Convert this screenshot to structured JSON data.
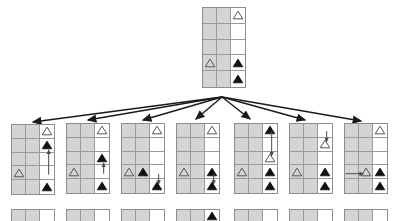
{
  "figure": {
    "colors": {
      "shaded_cell": "#d4d4d4",
      "empty_cell": "#ffffff",
      "grid_line": "#9a9a9a",
      "node_border": "#8d8d8d",
      "edge_arrow": "#1a1a1a",
      "move_arrow": "#4a4a4a",
      "token_fill": "#111111",
      "token_outline": "#555555"
    },
    "grid": {
      "columns": 3,
      "rows": 5,
      "shaded_columns": [
        0,
        1
      ],
      "open_columns": [
        2
      ]
    },
    "token_types": {
      "filled": "filled-triangle",
      "outline": "outline-triangle"
    }
  },
  "root": {
    "label": "root-state",
    "x": 202,
    "y": 7,
    "width": 44,
    "height": 81,
    "tokens": [
      {
        "row": 0,
        "col": 2,
        "type": "outline"
      },
      {
        "row": 3,
        "col": 0,
        "type": "outline"
      },
      {
        "row": 3,
        "col": 2,
        "type": "filled"
      },
      {
        "row": 4,
        "col": 2,
        "type": "filled"
      }
    ],
    "move_arrows": []
  },
  "edges": {
    "origin_x": 222,
    "origin_y": 97,
    "count": 7,
    "targets": [
      {
        "x": 33,
        "y": 122
      },
      {
        "x": 88,
        "y": 120
      },
      {
        "x": 143,
        "y": 120
      },
      {
        "x": 196,
        "y": 119
      },
      {
        "x": 250,
        "y": 119
      },
      {
        "x": 305,
        "y": 120
      },
      {
        "x": 361,
        "y": 121
      }
    ]
  },
  "children": [
    {
      "label": "child-state-1",
      "x": 11,
      "y": 124,
      "width": 44,
      "height": 71,
      "tokens": [
        {
          "row": 0,
          "col": 2,
          "type": "outline"
        },
        {
          "row": 1,
          "col": 2,
          "type": "filled"
        },
        {
          "row": 3,
          "col": 0,
          "type": "outline"
        },
        {
          "row": 4,
          "col": 2,
          "type": "filled"
        }
      ],
      "move_arrows": [
        {
          "col": 2,
          "from_row": 3,
          "to_row": 1,
          "direction": "up"
        }
      ]
    },
    {
      "label": "child-state-2",
      "x": 66,
      "y": 123,
      "width": 44,
      "height": 71,
      "tokens": [
        {
          "row": 0,
          "col": 2,
          "type": "outline"
        },
        {
          "row": 2,
          "col": 2,
          "type": "filled"
        },
        {
          "row": 3,
          "col": 0,
          "type": "outline"
        },
        {
          "row": 4,
          "col": 2,
          "type": "filled"
        }
      ],
      "move_arrows": [
        {
          "col": 2,
          "from_row": 3,
          "to_row": 2,
          "direction": "up"
        }
      ]
    },
    {
      "label": "child-state-3",
      "x": 121,
      "y": 123,
      "width": 44,
      "height": 71,
      "tokens": [
        {
          "row": 0,
          "col": 2,
          "type": "outline"
        },
        {
          "row": 3,
          "col": 0,
          "type": "outline"
        },
        {
          "row": 3,
          "col": 1,
          "type": "filled"
        },
        {
          "row": 4,
          "col": 2,
          "type": "filled"
        }
      ],
      "move_arrows": [
        {
          "col": 2,
          "from_row": 3,
          "to_row": 4,
          "direction": "down"
        }
      ]
    },
    {
      "label": "child-state-4",
      "x": 176,
      "y": 123,
      "width": 44,
      "height": 71,
      "tokens": [
        {
          "row": 0,
          "col": 2,
          "type": "outline"
        },
        {
          "row": 3,
          "col": 0,
          "type": "outline"
        },
        {
          "row": 3,
          "col": 2,
          "type": "filled"
        },
        {
          "row": 4,
          "col": 2,
          "type": "filled"
        }
      ],
      "move_arrows": [
        {
          "col": 2,
          "from_row": 3,
          "to_row": 4,
          "direction": "down"
        }
      ]
    },
    {
      "label": "child-state-5",
      "x": 234,
      "y": 123,
      "width": 44,
      "height": 71,
      "tokens": [
        {
          "row": 0,
          "col": 2,
          "type": "filled"
        },
        {
          "row": 2,
          "col": 2,
          "type": "outline"
        },
        {
          "row": 3,
          "col": 0,
          "type": "outline"
        },
        {
          "row": 3,
          "col": 2,
          "type": "filled"
        },
        {
          "row": 4,
          "col": 2,
          "type": "filled"
        }
      ],
      "move_arrows": [
        {
          "col": 2,
          "from_row": 0,
          "to_row": 2,
          "direction": "down"
        }
      ]
    },
    {
      "label": "child-state-6",
      "x": 289,
      "y": 123,
      "width": 44,
      "height": 71,
      "tokens": [
        {
          "row": 1,
          "col": 2,
          "type": "outline"
        },
        {
          "row": 3,
          "col": 0,
          "type": "outline"
        },
        {
          "row": 3,
          "col": 2,
          "type": "filled"
        },
        {
          "row": 4,
          "col": 2,
          "type": "filled"
        }
      ],
      "move_arrows": [
        {
          "col": 2,
          "from_row": 0,
          "to_row": 1,
          "direction": "down"
        }
      ]
    },
    {
      "label": "child-state-7",
      "x": 344,
      "y": 123,
      "width": 44,
      "height": 71,
      "tokens": [
        {
          "row": 0,
          "col": 2,
          "type": "outline"
        },
        {
          "row": 3,
          "col": 1,
          "type": "outline"
        },
        {
          "row": 3,
          "col": 2,
          "type": "filled"
        },
        {
          "row": 4,
          "col": 2,
          "type": "filled"
        }
      ],
      "move_arrows": [
        {
          "row": 3,
          "from_col": -0.45,
          "to_col": 1,
          "direction": "right"
        }
      ]
    }
  ],
  "caption_strip": {
    "visible": true,
    "nodes": [
      {
        "x": 11,
        "y": 200,
        "width": 44,
        "height": 14,
        "tokens": []
      },
      {
        "x": 66,
        "y": 200,
        "width": 44,
        "height": 14,
        "tokens": []
      },
      {
        "x": 121,
        "y": 200,
        "width": 44,
        "height": 14,
        "tokens": []
      },
      {
        "x": 176,
        "y": 200,
        "width": 44,
        "height": 14,
        "tokens": [
          {
            "row": 0,
            "col": 2,
            "type": "filled"
          }
        ]
      },
      {
        "x": 234,
        "y": 200,
        "width": 44,
        "height": 14,
        "tokens": []
      },
      {
        "x": 289,
        "y": 200,
        "width": 44,
        "height": 14,
        "tokens": []
      },
      {
        "x": 344,
        "y": 200,
        "width": 44,
        "height": 14,
        "tokens": []
      }
    ]
  }
}
